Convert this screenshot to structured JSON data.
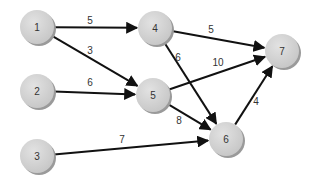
{
  "diagram": {
    "type": "directed-weighted-graph",
    "colors": {
      "node_fill": "#d4d4d4",
      "node_shadow": "#9a9a9a",
      "edge": "#111111",
      "text": "#333333",
      "background": "#ffffff"
    },
    "nodes": [
      {
        "id": "1",
        "label": "1",
        "x": 37,
        "y": 27
      },
      {
        "id": "2",
        "label": "2",
        "x": 37,
        "y": 91
      },
      {
        "id": "3",
        "label": "3",
        "x": 37,
        "y": 156
      },
      {
        "id": "4",
        "label": "4",
        "x": 155,
        "y": 28
      },
      {
        "id": "5",
        "label": "5",
        "x": 153,
        "y": 95
      },
      {
        "id": "6",
        "label": "6",
        "x": 226,
        "y": 139
      },
      {
        "id": "7",
        "label": "7",
        "x": 282,
        "y": 51
      }
    ],
    "edges": [
      {
        "from": "1",
        "to": "4",
        "weight": "5",
        "lx": 90,
        "ly": 20
      },
      {
        "from": "1",
        "to": "5",
        "weight": "3",
        "lx": 90,
        "ly": 50
      },
      {
        "from": "2",
        "to": "5",
        "weight": "6",
        "lx": 90,
        "ly": 82
      },
      {
        "from": "3",
        "to": "6",
        "weight": "7",
        "lx": 122,
        "ly": 139
      },
      {
        "from": "4",
        "to": "7",
        "weight": "5",
        "lx": 211,
        "ly": 29
      },
      {
        "from": "4",
        "to": "6",
        "weight": "6",
        "lx": 178,
        "ly": 57
      },
      {
        "from": "5",
        "to": "7",
        "weight": "10",
        "lx": 218,
        "ly": 62
      },
      {
        "from": "5",
        "to": "6",
        "weight": "8",
        "lx": 179,
        "ly": 120
      },
      {
        "from": "6",
        "to": "7",
        "weight": "4",
        "lx": 256,
        "ly": 101
      }
    ]
  }
}
